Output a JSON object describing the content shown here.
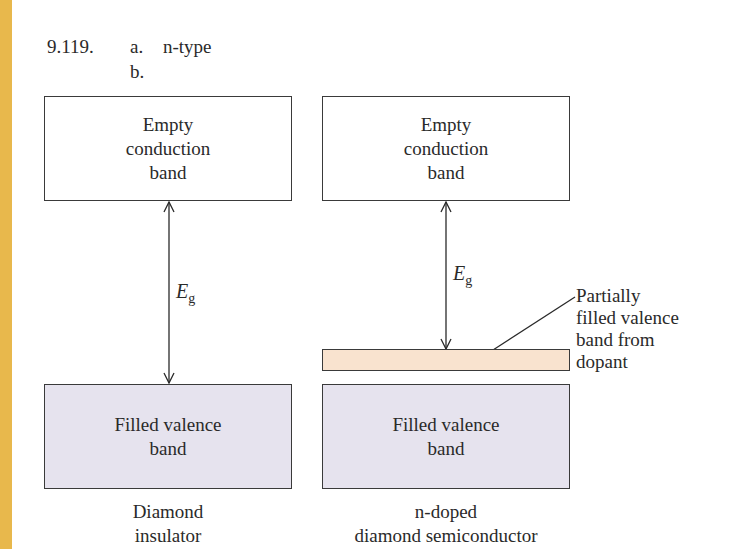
{
  "header": {
    "problem_number": "9.119.",
    "part_a_label": "a.",
    "part_a_answer": "n-type",
    "part_b_label": "b."
  },
  "colors": {
    "side_strip": "#e8b84c",
    "filled_band": "#e6e3ee",
    "dopant_band": "#f9e3cf",
    "empty_band": "#ffffff"
  },
  "diagrams": [
    {
      "conduction_band": "Empty conduction band",
      "conduction_lines": [
        "Empty",
        "conduction",
        "band"
      ],
      "gap_label": "E",
      "gap_subscript": "g",
      "valence_lines": [
        "Filled valence",
        "band"
      ],
      "caption_lines": [
        "Diamond",
        "insulator"
      ]
    },
    {
      "conduction_lines": [
        "Empty",
        "conduction",
        "band"
      ],
      "gap_label": "E",
      "gap_subscript": "g",
      "dopant_label_lines": [
        "Partially",
        "filled valence",
        "band from",
        "dopant"
      ],
      "valence_lines": [
        "Filled valence",
        "band"
      ],
      "caption_lines": [
        "n-doped",
        "diamond semiconductor"
      ]
    }
  ]
}
